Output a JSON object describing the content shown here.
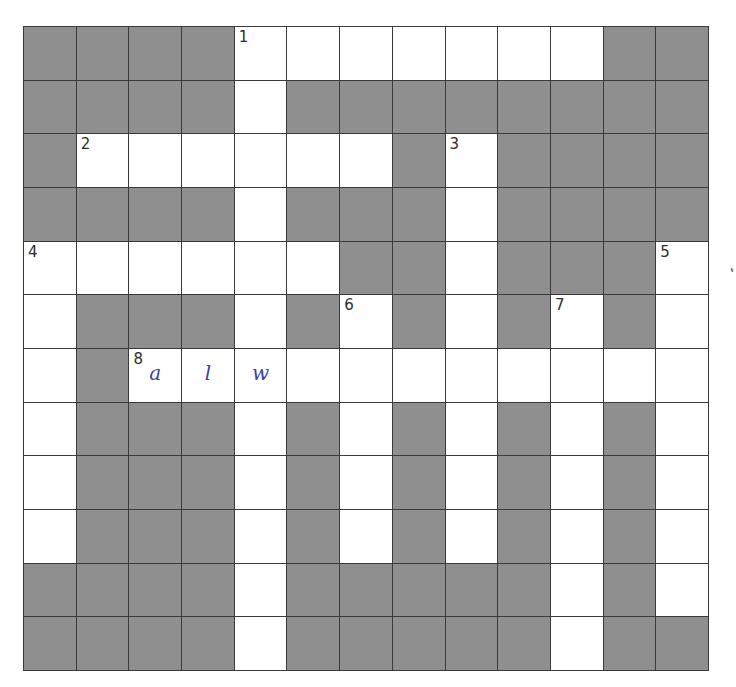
{
  "puzzle": {
    "rows": 12,
    "cols": 13,
    "colors": {
      "block": "#8f8f8f",
      "open": "#ffffff",
      "line": "#3a3a3a",
      "ink": "#3b3fa8"
    },
    "layout": [
      "####.......##",
      "####.########",
      "#......#.####",
      "####.###.####",
      "......##.###.",
      ".###.#.#.#.#.",
      ".#...........",
      ".###.#.#.#.#.",
      ".###.#.#.#.#.",
      ".###.#.#.#.#.",
      "####.#####.#.",
      "####.#####.##"
    ],
    "clue_numbers": [
      {
        "number": "1",
        "row": 0,
        "col": 4
      },
      {
        "number": "2",
        "row": 2,
        "col": 1
      },
      {
        "number": "3",
        "row": 2,
        "col": 8
      },
      {
        "number": "4",
        "row": 4,
        "col": 0
      },
      {
        "number": "5",
        "row": 4,
        "col": 12
      },
      {
        "number": "6",
        "row": 5,
        "col": 6
      },
      {
        "number": "7",
        "row": 5,
        "col": 10
      },
      {
        "number": "8",
        "row": 6,
        "col": 2
      }
    ],
    "entered_letters": [
      {
        "letter": "a",
        "row": 6,
        "col": 2
      },
      {
        "letter": "l",
        "row": 6,
        "col": 3
      },
      {
        "letter": "w",
        "row": 6,
        "col": 4
      }
    ]
  }
}
